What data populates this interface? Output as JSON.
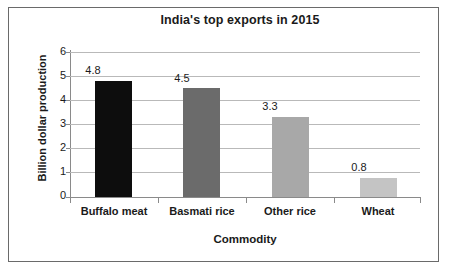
{
  "chart_data": {
    "type": "bar",
    "title": "India's top exports in 2015",
    "xlabel": "Commodity",
    "ylabel": "Billion dollar production",
    "categories": [
      "Buffalo meat",
      "Basmati rice",
      "Other rice",
      "Wheat"
    ],
    "values": [
      4.8,
      4.5,
      3.3,
      0.8
    ],
    "value_labels": [
      "4.8",
      "4.5",
      "3.3",
      "0.8"
    ],
    "bar_colors": [
      "#0d0d0d",
      "#6b6b6b",
      "#a8a8a8",
      "#c4c4c4"
    ],
    "ylim": [
      0,
      6
    ],
    "y_ticks": [
      "0",
      "1",
      "2",
      "3",
      "4",
      "5",
      "6"
    ],
    "grid": true,
    "legend": "none",
    "frame_color": "#6a6a6a",
    "gridline_color": "#b9b9b9",
    "axis_color": "#8a8a8a",
    "text_color": "#1a1a1a"
  }
}
